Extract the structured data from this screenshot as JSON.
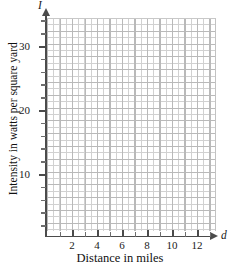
{
  "chart_data": {
    "type": "line",
    "title": "",
    "subtitle": "",
    "xlabel": "Distance in miles",
    "ylabel": "Intensity in watts per square yard",
    "x_variable": "d",
    "y_variable": "I",
    "xlim": [
      0,
      13.5
    ],
    "ylim": [
      0,
      34
    ],
    "x_ticks": [
      2,
      4,
      6,
      8,
      10,
      12
    ],
    "x_tick_labels": [
      "2",
      "4",
      "6",
      "8",
      "10",
      "12"
    ],
    "x_minor_tick_step": 1,
    "y_ticks": [
      10,
      20,
      30
    ],
    "y_tick_labels": [
      "10",
      "20",
      "30"
    ],
    "y_minor_tick_step": 2,
    "grid": true,
    "grid_major_color": "#b9b9b9",
    "grid_minor_color": "#9a9a9a",
    "grid_minor_style": "dotted",
    "axis_color": "#4b4b4b",
    "legend": null,
    "legend_position": "none",
    "series": [],
    "annotations": [],
    "note": "Blank coordinate grid with no plotted data; axes terminate in arrowheads."
  },
  "axes": {
    "y": {
      "variable": "I",
      "title": "Intensity in watts per square yard",
      "ticks": [
        {
          "value": 30,
          "label": "30",
          "top": 46
        },
        {
          "value": 20,
          "label": "20",
          "top": 110
        },
        {
          "value": 10,
          "label": "10",
          "top": 174
        }
      ],
      "minor_ticks": [
        {
          "value": 34,
          "top": 20.4
        },
        {
          "value": 32,
          "top": 33.2
        },
        {
          "value": 28,
          "top": 58.8
        },
        {
          "value": 26,
          "top": 71.6
        },
        {
          "value": 24,
          "top": 84.4
        },
        {
          "value": 22,
          "top": 97.2
        },
        {
          "value": 18,
          "top": 122.8
        },
        {
          "value": 16,
          "top": 135.6
        },
        {
          "value": 14,
          "top": 148.4
        },
        {
          "value": 12,
          "top": 161.2
        },
        {
          "value": 8,
          "top": 186.8
        },
        {
          "value": 6,
          "top": 199.6
        },
        {
          "value": 4,
          "top": 212.4
        },
        {
          "value": 2,
          "top": 225.2
        }
      ]
    },
    "x": {
      "variable": "d",
      "title": "Distance in miles",
      "ticks": [
        {
          "value": 2,
          "label": "2",
          "left": 72
        },
        {
          "value": 4,
          "label": "4",
          "left": 97
        },
        {
          "value": 6,
          "label": "6",
          "left": 122
        },
        {
          "value": 8,
          "label": "8",
          "left": 147
        },
        {
          "value": 10,
          "label": "10",
          "left": 172
        },
        {
          "value": 12,
          "label": "12",
          "left": 197
        }
      ],
      "minor_ticks": [
        {
          "value": 1,
          "left": 59.5
        },
        {
          "value": 3,
          "left": 84.5
        },
        {
          "value": 5,
          "left": 109.5
        },
        {
          "value": 7,
          "left": 134.5
        },
        {
          "value": 9,
          "left": 159.5
        },
        {
          "value": 11,
          "left": 184.5
        },
        {
          "value": 13,
          "left": 209.5
        }
      ]
    }
  }
}
